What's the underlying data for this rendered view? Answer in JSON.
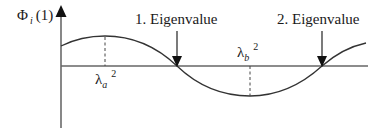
{
  "diagram": {
    "y_axis_label": {
      "symbol": "Φ",
      "subscript": "i",
      "argument": "(1)"
    },
    "annotations": [
      {
        "id": "eigenvalue-1",
        "text": "1. Eigenvalue"
      },
      {
        "id": "eigenvalue-2",
        "text": "2. Eigenvalue"
      }
    ],
    "markers": [
      {
        "id": "lambda-a",
        "symbol": "λ",
        "subscript": "a",
        "superscript": "2"
      },
      {
        "id": "lambda-b",
        "symbol": "λ",
        "subscript": "b",
        "superscript": "2"
      }
    ],
    "colors": {
      "line": "#333333",
      "axis": "#555555",
      "text": "#1a1a1a"
    }
  }
}
